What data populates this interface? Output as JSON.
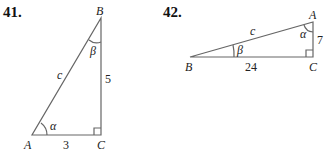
{
  "problems": [
    {
      "number": "41.",
      "vertices": {
        "A": "A",
        "B": "B",
        "C": "C"
      },
      "angles": {
        "alpha": "α",
        "beta": "β"
      },
      "sides": {
        "hypotenuse": "c",
        "vertical": "5",
        "horizontal": "3"
      }
    },
    {
      "number": "42.",
      "vertices": {
        "A": "A",
        "B": "B",
        "C": "C"
      },
      "angles": {
        "alpha": "α",
        "beta": "β"
      },
      "sides": {
        "hypotenuse": "c",
        "vertical": "7",
        "horizontal": "24"
      }
    }
  ]
}
